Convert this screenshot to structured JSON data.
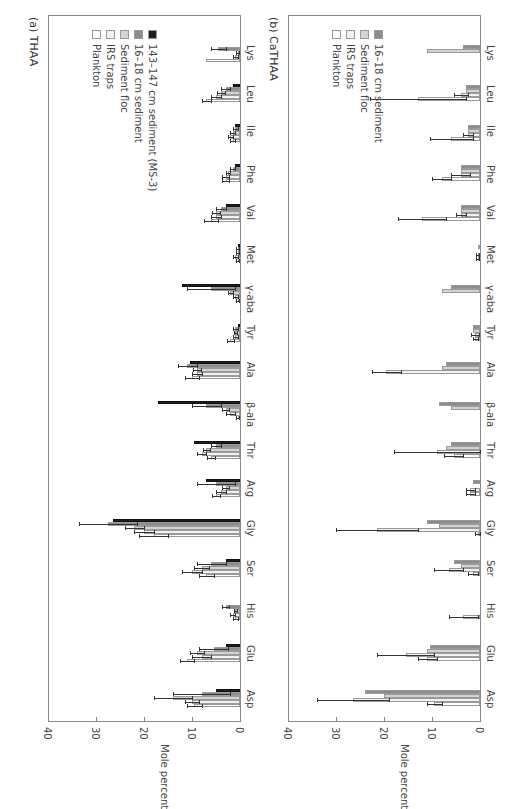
{
  "chart_data": [
    {
      "type": "bar",
      "orientation": "rotated-horizontal",
      "title": "(a) THAA",
      "xlabel": "",
      "ylabel": "Mole percent",
      "ylim": [
        0,
        40
      ],
      "ticks": [
        "0",
        "10",
        "20",
        "30",
        "40"
      ],
      "categories": [
        "Asp",
        "Glu",
        "His",
        "Ser",
        "Gly",
        "Arg",
        "Thr",
        "β-ala",
        "Ala",
        "Tyr",
        "γ-aba",
        "Met",
        "Val",
        "Phe",
        "Ile",
        "Leu",
        "Lys"
      ],
      "series": [
        {
          "name": "Plankton",
          "color": "#ffffff",
          "values": [
            9.5,
            11,
            1,
            7,
            18,
            5,
            6,
            0.5,
            10,
            2,
            0.5,
            0.5,
            6,
            3,
            1.5,
            7,
            7
          ],
          "err": [
            1.5,
            1.5,
            0.5,
            1.5,
            3,
            0.8,
            0.8,
            0.3,
            1.5,
            0.8,
            0.3,
            0.3,
            1.5,
            0.8,
            0.5,
            1,
            0
          ]
        },
        {
          "name": "IRS traps",
          "color": "#f2f2f2",
          "values": [
            10,
            8,
            1.5,
            10,
            20,
            4,
            8,
            2,
            9,
            1,
            1,
            1,
            5,
            3,
            2,
            5,
            1
          ],
          "err": [
            1.5,
            2,
            0.5,
            2,
            2,
            1,
            1,
            1,
            1,
            0.5,
            0.5,
            0.5,
            1,
            0.8,
            0.5,
            1,
            0.5
          ]
        },
        {
          "name": "Sediment floc",
          "color": "#d3d3d3",
          "values": [
            14,
            9,
            1,
            8,
            22,
            3,
            7,
            3,
            9,
            1,
            2,
            0.5,
            5,
            2.5,
            1.5,
            4,
            0.5
          ],
          "err": [
            4,
            1.5,
            0.3,
            1.5,
            2,
            0.8,
            0.8,
            0.8,
            0.8,
            0.3,
            0.5,
            0.3,
            0.8,
            0.5,
            0.5,
            0.8,
            0.3
          ]
        },
        {
          "name": "16–18 cm sediment",
          "color": "#8c8c8c",
          "values": [
            8,
            5.5,
            3,
            6,
            27.5,
            5,
            5,
            7,
            11,
            1,
            6,
            0.5,
            4,
            1.5,
            1,
            3,
            4.5
          ],
          "err": [
            6,
            3,
            0.8,
            3,
            6,
            4,
            1,
            3,
            2,
            0.5,
            5,
            0.3,
            1,
            0.5,
            0.5,
            1,
            1.5
          ]
        },
        {
          "name": "143–147 cm sediment (MS-3)",
          "color": "#1e1e1e",
          "values": [
            5,
            3,
            0,
            3,
            26.5,
            7,
            9.5,
            17,
            10.5,
            0.5,
            12,
            0.5,
            3,
            1,
            1,
            1.5,
            0
          ],
          "err": [
            0,
            0,
            0,
            0,
            0,
            0,
            0,
            0,
            0,
            0,
            0,
            0,
            0,
            0,
            0,
            0,
            0
          ]
        }
      ]
    },
    {
      "type": "bar",
      "orientation": "rotated-horizontal",
      "title": "(b) CaTHAA",
      "xlabel": "",
      "ylabel": "Mole percent",
      "ylim": [
        0,
        40
      ],
      "ticks": [
        "0",
        "10",
        "20",
        "30",
        "40"
      ],
      "categories": [
        "Asp",
        "Glu",
        "His",
        "Ser",
        "Gly",
        "Arg",
        "Thr",
        "β-ala",
        "Ala",
        "Tyr",
        "γ-aba",
        "Met",
        "Val",
        "Phe",
        "Ile",
        "Leu",
        "Lys"
      ],
      "series": [
        {
          "name": "Plankton",
          "color": "#ffffff",
          "values": [
            9.5,
            11,
            3.5,
            1.5,
            0.5,
            2,
            5.5,
            0,
            0,
            1,
            0,
            0.5,
            12,
            8,
            6,
            13,
            0
          ],
          "err": [
            1.5,
            2,
            3,
            1,
            0.5,
            1,
            2,
            0,
            0,
            0.5,
            0,
            0.3,
            5,
            2,
            4.5,
            10,
            0
          ]
        },
        {
          "name": "IRS traps",
          "color": "#f2f2f2",
          "values": [
            26.5,
            15.5,
            0,
            6.5,
            21.5,
            2,
            9,
            0,
            19.5,
            1,
            0,
            0.5,
            4,
            4,
            2.5,
            4,
            0
          ],
          "err": [
            7.5,
            6,
            0,
            3,
            8.5,
            1,
            9,
            0,
            3,
            0.8,
            0,
            0.3,
            1,
            2,
            1,
            1.5,
            0
          ]
        },
        {
          "name": "Sediment floc",
          "color": "#d3d3d3",
          "values": [
            20,
            11,
            0,
            4,
            8.5,
            0,
            7,
            6,
            8,
            1.5,
            8,
            0,
            4,
            4,
            2.5,
            3,
            11
          ],
          "err": [
            0,
            0,
            0,
            0,
            0,
            0,
            0,
            0,
            0,
            0,
            0,
            0,
            0,
            0,
            0,
            0,
            0
          ]
        },
        {
          "name": "16–18 cm sediment",
          "color": "#8c8c8c",
          "values": [
            24,
            10.5,
            0,
            5.5,
            11,
            1.5,
            6,
            8.5,
            7,
            1.5,
            6,
            0.5,
            4,
            4,
            2.5,
            3,
            3.5
          ],
          "err": [
            0,
            0,
            0,
            0,
            0,
            0,
            0,
            0,
            0,
            0,
            0,
            0,
            0,
            0,
            0,
            0,
            0
          ]
        }
      ]
    }
  ],
  "panels": {
    "a": {
      "title": "(a) THAA",
      "axis_title": "Mole percent"
    },
    "b": {
      "title": "(b) CaTHAA",
      "axis_title": "Mole percent"
    }
  },
  "legend_a": [
    "Plankton",
    "IRS traps",
    "Sediment floc",
    "16–18 cm sediment",
    "143–147 cm sediment (MS-3)"
  ],
  "legend_b": [
    "Plankton",
    "IRS traps",
    "Sediment floc",
    "16–18 cm sediment"
  ],
  "colors": {
    "plankton": "#ffffff",
    "irs": "#f2f2f2",
    "floc": "#d3d3d3",
    "sed16": "#8c8c8c",
    "sed143": "#1e1e1e",
    "axis": "#8a8a8a"
  }
}
